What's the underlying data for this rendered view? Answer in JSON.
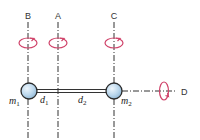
{
  "diagram": {
    "type": "two-mass rod rotation axes",
    "colors": {
      "axis": "#333333",
      "rotation_arrow": "#d0436a",
      "ball_fill": "#b9d6ec",
      "ball_stroke": "#2a2a2a",
      "rod": "#333333"
    },
    "axes": [
      {
        "id": "B",
        "label": "B",
        "orientation": "vertical",
        "position": "through m1"
      },
      {
        "id": "A",
        "label": "A",
        "orientation": "vertical",
        "position": "between m1 and m2"
      },
      {
        "id": "C",
        "label": "C",
        "orientation": "vertical",
        "position": "through m2"
      },
      {
        "id": "D",
        "label": "D",
        "orientation": "horizontal",
        "position": "along rod"
      }
    ],
    "masses": [
      {
        "id": "m1",
        "label": "m",
        "subscript": "1"
      },
      {
        "id": "m2",
        "label": "m",
        "subscript": "2"
      }
    ],
    "distances": [
      {
        "id": "d1",
        "label": "d",
        "subscript": "1"
      },
      {
        "id": "d2",
        "label": "d",
        "subscript": "2"
      }
    ]
  }
}
